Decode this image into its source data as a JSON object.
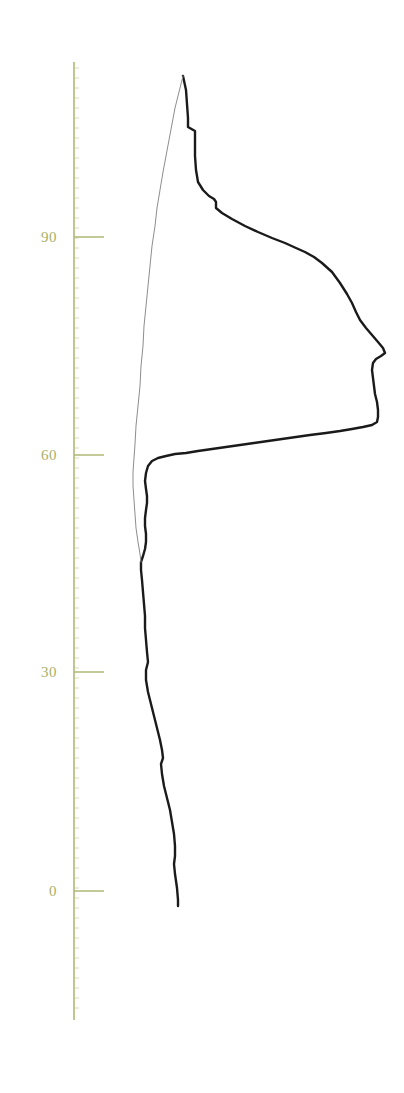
{
  "chart_data": {
    "type": "line",
    "title": "",
    "subtitle": "",
    "xlabel": "",
    "ylabel": "",
    "orientation": "vertical",
    "grid": false,
    "legend": null,
    "axis": {
      "position": "left",
      "color": "#b0b875",
      "line_x": 74,
      "line_top_y": 62,
      "line_bottom_y": 1020,
      "tick_length": 30,
      "tick_side": "right",
      "minor_ticks": true,
      "minor_tick_spacing_px": 10,
      "minor_tick_length": 4
    },
    "ylim": [
      -11,
      128
    ],
    "ticks": [
      {
        "label": "0",
        "value": 0,
        "y": 891
      },
      {
        "label": "30",
        "value": 30,
        "y": 672
      },
      {
        "label": "60",
        "value": 60,
        "y": 455
      },
      {
        "label": "90",
        "value": 90,
        "y": 237
      }
    ],
    "tick_labels": [
      "0",
      "30",
      "60",
      "90"
    ],
    "tick_label_color": "#a8b06a",
    "series": [
      {
        "name": "profile-main",
        "style": "solid",
        "color": "#1a1a1a",
        "width": 2.4,
        "points": [
          [
            183,
            76
          ],
          [
            186,
            90
          ],
          [
            187,
            104
          ],
          [
            188,
            118
          ],
          [
            188,
            127
          ],
          [
            195,
            131
          ],
          [
            195,
            142
          ],
          [
            195,
            156
          ],
          [
            196,
            170
          ],
          [
            198,
            182
          ],
          [
            203,
            190
          ],
          [
            209,
            196
          ],
          [
            214,
            199
          ],
          [
            216,
            202
          ],
          [
            216,
            208
          ],
          [
            222,
            213
          ],
          [
            232,
            219
          ],
          [
            245,
            226
          ],
          [
            258,
            232
          ],
          [
            272,
            238
          ],
          [
            285,
            243
          ],
          [
            296,
            248
          ],
          [
            305,
            252
          ],
          [
            314,
            257
          ],
          [
            322,
            263
          ],
          [
            332,
            272
          ],
          [
            340,
            283
          ],
          [
            347,
            294
          ],
          [
            352,
            303
          ],
          [
            356,
            312
          ],
          [
            360,
            320
          ],
          [
            366,
            328
          ],
          [
            372,
            335
          ],
          [
            378,
            342
          ],
          [
            383,
            348
          ],
          [
            385,
            353
          ],
          [
            381,
            356
          ],
          [
            376,
            359
          ],
          [
            373,
            363
          ],
          [
            372,
            370
          ],
          [
            373,
            378
          ],
          [
            374,
            386
          ],
          [
            375,
            394
          ],
          [
            377,
            402
          ],
          [
            378,
            410
          ],
          [
            378,
            417
          ],
          [
            377,
            422
          ],
          [
            372,
            425
          ],
          [
            363,
            427
          ],
          [
            352,
            429
          ],
          [
            340,
            431
          ],
          [
            326,
            433
          ],
          [
            310,
            435
          ],
          [
            296,
            437
          ],
          [
            282,
            439
          ],
          [
            268,
            441
          ],
          [
            254,
            443
          ],
          [
            240,
            445
          ],
          [
            226,
            447
          ],
          [
            212,
            449
          ],
          [
            198,
            451
          ],
          [
            186,
            453
          ],
          [
            175,
            454
          ],
          [
            166,
            456
          ],
          [
            158,
            458
          ],
          [
            152,
            461
          ],
          [
            148,
            466
          ],
          [
            146,
            473
          ],
          [
            145,
            481
          ],
          [
            146,
            489
          ],
          [
            147,
            496
          ],
          [
            147,
            503
          ],
          [
            146,
            510
          ],
          [
            145,
            518
          ],
          [
            145,
            526
          ],
          [
            146,
            534
          ],
          [
            146,
            542
          ],
          [
            145,
            549
          ],
          [
            143,
            556
          ],
          [
            141,
            562
          ],
          [
            141,
            570
          ],
          [
            142,
            580
          ],
          [
            143,
            592
          ],
          [
            144,
            604
          ],
          [
            145,
            616
          ],
          [
            145,
            628
          ],
          [
            146,
            640
          ],
          [
            147,
            652
          ],
          [
            148,
            662
          ],
          [
            146,
            670
          ],
          [
            146,
            680
          ],
          [
            148,
            692
          ],
          [
            151,
            704
          ],
          [
            154,
            716
          ],
          [
            157,
            728
          ],
          [
            160,
            740
          ],
          [
            162,
            750
          ],
          [
            163,
            758
          ],
          [
            161,
            764
          ],
          [
            162,
            774
          ],
          [
            164,
            786
          ],
          [
            167,
            798
          ],
          [
            170,
            810
          ],
          [
            172,
            822
          ],
          [
            174,
            834
          ],
          [
            175,
            846
          ],
          [
            175,
            856
          ],
          [
            174,
            864
          ],
          [
            175,
            874
          ],
          [
            177,
            888
          ],
          [
            178,
            900
          ],
          [
            178,
            906
          ]
        ]
      },
      {
        "name": "profile-secondary",
        "style": "solid",
        "color": "#8d8d8d",
        "width": 1.0,
        "points": [
          [
            183,
            76
          ],
          [
            179,
            92
          ],
          [
            175,
            108
          ],
          [
            172,
            124
          ],
          [
            169,
            140
          ],
          [
            166,
            156
          ],
          [
            163,
            172
          ],
          [
            160,
            190
          ],
          [
            157,
            208
          ],
          [
            155,
            226
          ],
          [
            152,
            246
          ],
          [
            150,
            266
          ],
          [
            148,
            286
          ],
          [
            146,
            306
          ],
          [
            144,
            326
          ],
          [
            143,
            346
          ],
          [
            141,
            366
          ],
          [
            140,
            386
          ],
          [
            138,
            406
          ],
          [
            136,
            426
          ],
          [
            135,
            444
          ],
          [
            134,
            458
          ],
          [
            133,
            472
          ],
          [
            133,
            486
          ],
          [
            134,
            500
          ],
          [
            135,
            514
          ],
          [
            136,
            528
          ],
          [
            138,
            542
          ],
          [
            140,
            554
          ],
          [
            141,
            562
          ]
        ]
      }
    ],
    "background_color": "#ffffff"
  }
}
